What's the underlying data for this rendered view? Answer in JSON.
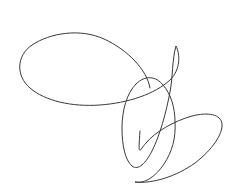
{
  "canvas": {
    "width": 242,
    "height": 188,
    "background_color": "#ffffff",
    "description": "freehand-loop-sketch"
  },
  "drawing": {
    "type": "freehand-stroke",
    "stroke_color": "#3a3a3c",
    "stroke_width": 1,
    "stroke_opacity": 1,
    "fill": "none",
    "continuous": true,
    "loop_count": 3,
    "loops": [
      {
        "name": "large-horizontal-loop",
        "shape": "ellipse",
        "center_x": 98,
        "center_y": 68,
        "radius_x": 80,
        "radius_y": 38,
        "rotation_deg": -3,
        "bounds": [
          18,
          30,
          178,
          107
        ]
      },
      {
        "name": "narrow-vertical-loop",
        "shape": "ellipse",
        "center_x": 143,
        "center_y": 122,
        "radius_x": 25,
        "radius_y": 47,
        "rotation_deg": 12,
        "bounds": [
          118,
          76,
          169,
          169
        ]
      },
      {
        "name": "tilted-lower-right-loop",
        "shape": "ellipse",
        "center_x": 181,
        "center_y": 156,
        "radius_x": 53,
        "radius_y": 29,
        "rotation_deg": -34,
        "bounds": [
          139,
          113,
          223,
          184
        ]
      }
    ],
    "path_d": "M 150 88 C 147 70 128 50 104 39 C 80 28 50 33 32 45 C 16 56 16 76 30 88 C 45 101 72 107 100 105 C 128 103 155 94 170 80 C 181 69 180 54 176 46 C 172 60 173 76 170 92 C 166 113 160 135 152 151 C 146 163 138 171 132 166 C 125 160 122 145 122 128 C 122 110 127 93 136 84 C 145 75 156 76 163 85 C 171 94 175 108 175 122 C 176 138 172 152 164 164 C 156 176 145 184 135 182 C 153 184 177 176 195 163 C 212 150 223 134 222 124 C 221 114 208 112 192 116 C 174 121 155 132 146 143 C 139 151 138 158 140 131"
  },
  "segments": [
    {
      "name": "large-loop-top-arc",
      "from": [
        150,
        88
      ],
      "to": [
        32,
        45
      ],
      "note": "sweeps up-left across top of large ellipse"
    },
    {
      "name": "large-loop-left-arc",
      "from": [
        32,
        45
      ],
      "to": [
        30,
        88
      ],
      "note": "left extremity, leftmost x approx 18"
    },
    {
      "name": "large-loop-bottom-arc",
      "from": [
        30,
        88
      ],
      "to": [
        170,
        80
      ],
      "note": "bottom of large ellipse, lowest y approx 106"
    },
    {
      "name": "transition-to-middle-loop",
      "from": [
        170,
        80
      ],
      "to": [
        136,
        84
      ],
      "note": "right edge descends then curves into narrow loop"
    },
    {
      "name": "narrow-loop-arc",
      "from": [
        136,
        84
      ],
      "to": [
        135,
        182
      ],
      "note": "tall narrow tilted ellipse, bottom tip approx (135,168)"
    },
    {
      "name": "lower-right-loop-arc",
      "from": [
        135,
        182
      ],
      "to": [
        140,
        131
      ],
      "note": "tilted ellipse sweeping to right extremity x approx 222"
    }
  ]
}
